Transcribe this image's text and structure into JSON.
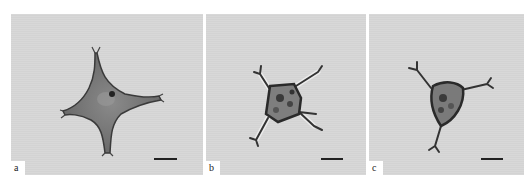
{
  "figure": {
    "background": "#ffffff",
    "panel_background": "#d6d6d6",
    "panels": [
      {
        "id": "a",
        "label": "a",
        "description": "four-armed cell with long slender horns, cross-shaped",
        "scalebar": true
      },
      {
        "id": "b",
        "label": "b",
        "description": "cell with quadrate body and four short forked, blurred arms",
        "scalebar": true
      },
      {
        "id": "c",
        "label": "c",
        "description": "triangular cell body with three forked arms",
        "scalebar": true
      }
    ]
  }
}
